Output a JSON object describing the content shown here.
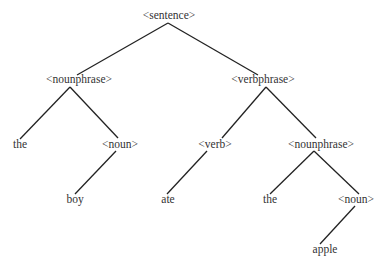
{
  "diagram": {
    "type": "parse-tree",
    "nodes": {
      "sentence": {
        "label": "<sentence>",
        "x": 169,
        "y": 9
      },
      "nounphrase_1": {
        "label": "<nounphrase>",
        "x": 79,
        "y": 73
      },
      "verbphrase": {
        "label": "<verbphrase>",
        "x": 263,
        "y": 73
      },
      "the_1": {
        "label": "the",
        "x": 20,
        "y": 138
      },
      "noun_1": {
        "label": "<noun>",
        "x": 120,
        "y": 138
      },
      "verb": {
        "label": "<verb>",
        "x": 215,
        "y": 138
      },
      "nounphrase_2": {
        "label": "<nounphrase>",
        "x": 321,
        "y": 138
      },
      "boy": {
        "label": "boy",
        "x": 75,
        "y": 193
      },
      "ate": {
        "label": "ate",
        "x": 168,
        "y": 193
      },
      "the_2": {
        "label": "the",
        "x": 270,
        "y": 193
      },
      "noun_2": {
        "label": "<noun>",
        "x": 356,
        "y": 193
      },
      "apple": {
        "label": "apple",
        "x": 325,
        "y": 243
      }
    },
    "edges": [
      {
        "from": "sentence",
        "to": "nounphrase_1"
      },
      {
        "from": "sentence",
        "to": "verbphrase"
      },
      {
        "from": "nounphrase_1",
        "to": "the_1"
      },
      {
        "from": "nounphrase_1",
        "to": "noun_1"
      },
      {
        "from": "noun_1",
        "to": "boy"
      },
      {
        "from": "verbphrase",
        "to": "verb"
      },
      {
        "from": "verbphrase",
        "to": "nounphrase_2"
      },
      {
        "from": "verb",
        "to": "ate"
      },
      {
        "from": "nounphrase_2",
        "to": "the_2"
      },
      {
        "from": "nounphrase_2",
        "to": "noun_2"
      },
      {
        "from": "noun_2",
        "to": "apple"
      }
    ],
    "colors": {
      "line": "#222222",
      "text": "#333333",
      "background": "#ffffff"
    }
  }
}
